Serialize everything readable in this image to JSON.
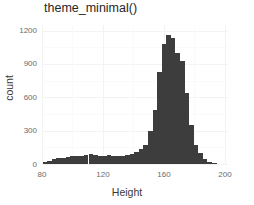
{
  "chart_data": {
    "type": "bar",
    "title": "theme_minimal()",
    "xlabel": "Height",
    "ylabel": "count",
    "xlim": [
      80,
      202
    ],
    "ylim": [
      0,
      1250
    ],
    "grid": true,
    "legend_position": "none",
    "bar_color": "#3d3d3d",
    "background_color": "#ffffff",
    "gridline_color": "#f3f3f3",
    "bin_width": 3,
    "xticks": [
      80,
      120,
      160,
      200
    ],
    "xtick_labels": [
      "80",
      "120",
      "160",
      "200"
    ],
    "yticks": [
      0,
      300,
      600,
      900,
      1200
    ],
    "ytick_labels": [
      "0",
      "300",
      "600",
      "900",
      "1200"
    ],
    "y_minor_ticks": [
      150,
      450,
      750,
      1050
    ],
    "x_minor_ticks": [
      100,
      140,
      180,
      200
    ],
    "x": [
      82,
      85,
      88,
      91,
      94,
      97,
      100,
      103,
      106,
      109,
      112,
      115,
      118,
      121,
      124,
      127,
      130,
      133,
      136,
      139,
      142,
      145,
      148,
      151,
      154,
      157,
      160,
      163,
      166,
      169,
      172,
      175,
      178,
      181,
      184,
      187,
      190,
      193
    ],
    "values": [
      18,
      30,
      42,
      52,
      58,
      66,
      70,
      74,
      76,
      80,
      92,
      78,
      74,
      70,
      78,
      72,
      70,
      74,
      78,
      86,
      104,
      132,
      168,
      300,
      490,
      830,
      1075,
      1160,
      1130,
      1000,
      930,
      640,
      350,
      170,
      100,
      48,
      20,
      10
    ],
    "categories": [
      "82",
      "85",
      "88",
      "91",
      "94",
      "97",
      "100",
      "103",
      "106",
      "109",
      "112",
      "115",
      "118",
      "121",
      "124",
      "127",
      "130",
      "133",
      "136",
      "139",
      "142",
      "145",
      "148",
      "151",
      "154",
      "157",
      "160",
      "163",
      "166",
      "169",
      "172",
      "175",
      "178",
      "181",
      "184",
      "187",
      "190",
      "193"
    ]
  }
}
